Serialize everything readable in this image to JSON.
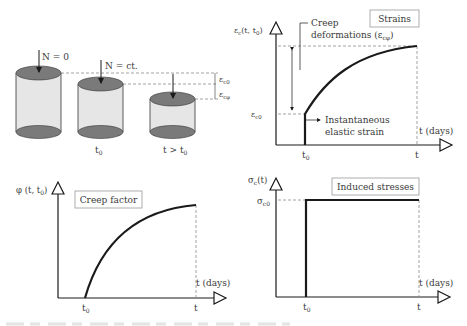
{
  "cylinders": {
    "c1_label": "N = 0",
    "c2_label": "N = ct.",
    "c2_caption": "t",
    "c2_caption_sub": "0",
    "c3_caption": "t > t",
    "c3_caption_sub": "0",
    "eps_c0": "ε",
    "eps_c0_sub": "c0",
    "eps_cphi": "ε",
    "eps_cphi_sub": "cφ"
  },
  "strains_chart": {
    "title": "Strains",
    "ylabel": "ε",
    "ylabel_sub": "c",
    "ylabel_rest": "(t, t",
    "ylabel_rest_sub": "0",
    "ylabel_close": ")",
    "xlabel": "t (days)",
    "t0": "t",
    "t0_sub": "0",
    "t": "t",
    "eps_c0": "ε",
    "eps_c0_sub": "c0",
    "creep_line1": "Creep",
    "creep_line2": "deformations (ε",
    "creep_line2_sub": "cφ",
    "creep_line2_close": ")",
    "inst_line1": "Instantaneous",
    "inst_line2": "elastic strain"
  },
  "creep_chart": {
    "title": "Creep factor",
    "ylabel": "φ (t, t",
    "ylabel_sub": "0",
    "ylabel_close": ")",
    "xlabel": "t (days)",
    "t0": "t",
    "t0_sub": "0",
    "t": "t"
  },
  "stress_chart": {
    "title": "Induced stresses",
    "ylabel": "σ",
    "ylabel_sub": "c",
    "ylabel_rest": "(t)",
    "xlabel": "t (days)",
    "t0": "t",
    "t0_sub": "0",
    "t": "t",
    "sigma_c0": "σ",
    "sigma_c0_sub": "c0"
  },
  "colors": {
    "line": "#1a1a1a",
    "cylinder_cap": "#7a7a7a",
    "cylinder_body": "#e6e6e6",
    "dashed": "#8a8a8a",
    "box_border": "#9a9a9a"
  }
}
